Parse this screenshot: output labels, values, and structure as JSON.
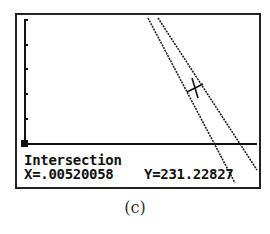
{
  "calculator_screen": {
    "mode": "graph",
    "readout": {
      "label": "Intersection",
      "x": "X=.00520058",
      "y": "Y=231.22827"
    },
    "axes": {
      "y_axis_ticks": 5,
      "x_axis": "horizontal baseline"
    },
    "curves": [
      {
        "name": "line-1",
        "description": "steeper decreasing line"
      },
      {
        "name": "line-2",
        "description": "less steep decreasing line"
      }
    ],
    "cursor": {
      "type": "cross",
      "at": "intersection"
    }
  },
  "caption": "(c)"
}
